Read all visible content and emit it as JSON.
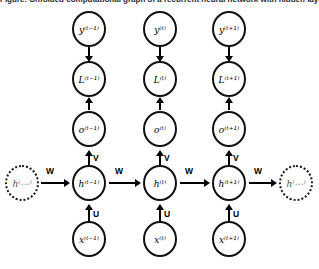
{
  "figure": {
    "title": "Figure: Unfolded computational graph of a recurrent neural network with hidden layer",
    "background_color": "#ffffff",
    "stroke_color": "#000000"
  },
  "nodes": {
    "y": [
      {
        "label": "y⁽ᵗ⁻¹⁾",
        "name": "node-y-t-minus-1"
      },
      {
        "label": "y⁽ᵗ⁾",
        "name": "node-y-t"
      },
      {
        "label": "y⁽ᵗ⁺¹⁾",
        "name": "node-y-t-plus-1"
      }
    ],
    "L": [
      {
        "label": "L⁽ᵗ⁻¹⁾",
        "name": "node-L-t-minus-1"
      },
      {
        "label": "L⁽ᵗ⁾",
        "name": "node-L-t"
      },
      {
        "label": "L⁽ᵗ⁺¹⁾",
        "name": "node-L-t-plus-1"
      }
    ],
    "o": [
      {
        "label": "o⁽ᵗ⁻¹⁾",
        "name": "node-o-t-minus-1"
      },
      {
        "label": "o⁽ᵗ⁾",
        "name": "node-o-t"
      },
      {
        "label": "o⁽ᵗ⁺¹⁾",
        "name": "node-o-t-plus-1"
      }
    ],
    "h": [
      {
        "label": "h⁽⋯⁾",
        "name": "node-h-prev-ellipsis",
        "dashed": true
      },
      {
        "label": "h⁽ᵗ⁻¹⁾",
        "name": "node-h-t-minus-1",
        "dashed": false
      },
      {
        "label": "h⁽ᵗ⁾",
        "name": "node-h-t",
        "dashed": false
      },
      {
        "label": "h⁽ᵗ⁺¹⁾",
        "name": "node-h-t-plus-1",
        "dashed": false
      },
      {
        "label": "h⁽⋯⁾",
        "name": "node-h-next-ellipsis",
        "dashed": true
      }
    ],
    "x": [
      {
        "label": "x⁽ᵗ⁻¹⁾",
        "name": "node-x-t-minus-1"
      },
      {
        "label": "x⁽ᵗ⁾",
        "name": "node-x-t"
      },
      {
        "label": "x⁽ᵗ⁺¹⁾",
        "name": "node-x-t-plus-1"
      }
    ]
  },
  "weights": {
    "input_to_hidden": "U",
    "hidden_to_output": "V",
    "hidden_to_hidden": "W",
    "w_labels": [
      "W",
      "W",
      "W",
      "W"
    ],
    "v_labels": [
      "V",
      "V",
      "V"
    ],
    "u_labels": [
      "U",
      "U",
      "U"
    ]
  }
}
